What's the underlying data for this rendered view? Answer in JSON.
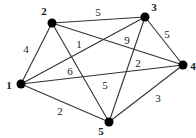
{
  "diagram": {
    "type": "weighted-graph",
    "nodes": [
      {
        "id": "1",
        "label": "1",
        "x": 21,
        "y": 84,
        "lx": 9,
        "ly": 85
      },
      {
        "id": "2",
        "label": "2",
        "x": 52,
        "y": 23,
        "lx": 44,
        "ly": 11
      },
      {
        "id": "3",
        "label": "3",
        "x": 145,
        "y": 17,
        "lx": 154,
        "ly": 7
      },
      {
        "id": "4",
        "label": "4",
        "x": 183,
        "y": 65,
        "lx": 193,
        "ly": 66
      },
      {
        "id": "5",
        "label": "5",
        "x": 109,
        "y": 122,
        "lx": 101,
        "ly": 131
      }
    ],
    "edges": [
      {
        "from": "1",
        "to": "2",
        "weight": "4",
        "lx": 26,
        "ly": 49
      },
      {
        "from": "2",
        "to": "3",
        "weight": "5",
        "lx": 98,
        "ly": 12
      },
      {
        "from": "3",
        "to": "4",
        "weight": "5",
        "lx": 167,
        "ly": 34
      },
      {
        "from": "4",
        "to": "5",
        "weight": "3",
        "lx": 158,
        "ly": 98
      },
      {
        "from": "1",
        "to": "5",
        "weight": "2",
        "lx": 60,
        "ly": 111
      },
      {
        "from": "2",
        "to": "4",
        "weight": "1",
        "lx": 79,
        "ly": 44
      },
      {
        "from": "1",
        "to": "3",
        "weight": "9",
        "lx": 127,
        "ly": 40
      },
      {
        "from": "1",
        "to": "4",
        "weight": "6",
        "lx": 70,
        "ly": 71
      },
      {
        "from": "2",
        "to": "5",
        "weight": "5",
        "lx": 105,
        "ly": 85
      },
      {
        "from": "3",
        "to": "5",
        "weight": "2",
        "lx": 138,
        "ly": 63
      }
    ]
  }
}
